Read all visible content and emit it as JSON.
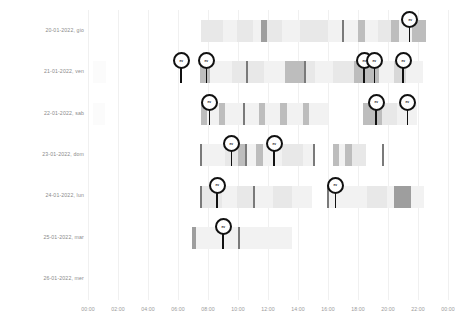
{
  "chart_data": {
    "type": "heatmap",
    "title": "",
    "xlabel": "",
    "ylabel": "",
    "grid": true,
    "legend": "none",
    "x_axis": {
      "min_hour": 0,
      "max_hour": 24,
      "tick_labels": [
        "00:00",
        "02:00",
        "04:00",
        "06:00",
        "08:00",
        "10:00",
        "12:00",
        "14:00",
        "16:00",
        "18:00",
        "20:00",
        "22:00",
        "00:00"
      ],
      "tick_hours": [
        0,
        2,
        4,
        6,
        8,
        10,
        12,
        14,
        16,
        18,
        20,
        22,
        24
      ]
    },
    "y_axis": {
      "categories": [
        "20-01-2022, gio",
        "21-01-2022, ven",
        "22-01-2022, sab",
        "23-01-2022, dom",
        "24-01-2022, lun",
        "25-01-2022, mar",
        "26-01-2022, mer"
      ]
    },
    "colors": {
      "background": "#ffffff",
      "gridline": "#f0f0f0",
      "label_text": "#8a8a8a",
      "tick_text": "#9a9a9a",
      "marker_stroke": "#111111",
      "marker_fill": "#ffffff",
      "intensity_scale": [
        "#fbfbfb",
        "#f2f2f2",
        "#e8e8e8",
        "#d8d8d8",
        "#bdbdbd",
        "#9e9e9e",
        "#7a7a7a",
        "#5a5a5a"
      ]
    },
    "rows": [
      {
        "label": "20-01-2022, gio",
        "segments": [
          {
            "start": 7.55,
            "end": 9.0,
            "value": 0.28
          },
          {
            "start": 9.0,
            "end": 9.9,
            "value": 0.12
          },
          {
            "start": 9.9,
            "end": 11.0,
            "value": 0.26
          },
          {
            "start": 11.0,
            "end": 11.5,
            "value": 0.1
          },
          {
            "start": 11.5,
            "end": 11.95,
            "value": 0.78
          },
          {
            "start": 11.95,
            "end": 12.9,
            "value": 0.22
          },
          {
            "start": 12.9,
            "end": 14.1,
            "value": 0.09
          },
          {
            "start": 14.1,
            "end": 15.3,
            "value": 0.22
          },
          {
            "start": 15.3,
            "end": 16.0,
            "value": 0.32
          },
          {
            "start": 16.0,
            "end": 16.9,
            "value": 0.09
          },
          {
            "start": 16.9,
            "end": 17.05,
            "value": 0.82
          },
          {
            "start": 17.05,
            "end": 18.0,
            "value": 0.09
          },
          {
            "start": 18.0,
            "end": 18.45,
            "value": 0.58
          },
          {
            "start": 18.45,
            "end": 19.3,
            "value": 0.1
          },
          {
            "start": 19.3,
            "end": 20.2,
            "value": 0.3
          },
          {
            "start": 20.2,
            "end": 20.75,
            "value": 0.55
          },
          {
            "start": 20.75,
            "end": 21.6,
            "value": 0.2
          },
          {
            "start": 21.6,
            "end": 22.55,
            "value": 0.62
          }
        ],
        "markers": [
          {
            "hour": 21.45,
            "label": "ev"
          }
        ]
      },
      {
        "label": "21-01-2022, ven",
        "segments": [
          {
            "start": 0.35,
            "end": 1.2,
            "value": 0.06
          },
          {
            "start": 7.45,
            "end": 8.1,
            "value": 0.52
          },
          {
            "start": 8.1,
            "end": 9.6,
            "value": 0.2
          },
          {
            "start": 9.6,
            "end": 10.5,
            "value": 0.28
          },
          {
            "start": 10.5,
            "end": 10.65,
            "value": 0.8
          },
          {
            "start": 10.65,
            "end": 11.7,
            "value": 0.22
          },
          {
            "start": 11.7,
            "end": 13.1,
            "value": 0.1
          },
          {
            "start": 13.1,
            "end": 14.4,
            "value": 0.55
          },
          {
            "start": 14.4,
            "end": 14.55,
            "value": 0.85
          },
          {
            "start": 14.55,
            "end": 15.1,
            "value": 0.34
          },
          {
            "start": 15.1,
            "end": 16.3,
            "value": 0.12
          },
          {
            "start": 16.3,
            "end": 17.7,
            "value": 0.24
          },
          {
            "start": 17.7,
            "end": 19.4,
            "value": 0.6
          },
          {
            "start": 19.4,
            "end": 20.4,
            "value": 0.14
          },
          {
            "start": 20.4,
            "end": 21.2,
            "value": 0.46
          },
          {
            "start": 21.2,
            "end": 22.3,
            "value": 0.12
          }
        ],
        "markers": [
          {
            "hour": 6.2,
            "label": "ev"
          },
          {
            "hour": 7.9,
            "label": "ev"
          },
          {
            "hour": 18.4,
            "label": "ev"
          },
          {
            "hour": 19.1,
            "label": "ev"
          },
          {
            "hour": 21.0,
            "label": "ev"
          }
        ]
      },
      {
        "label": "22-01-2022, sab",
        "segments": [
          {
            "start": 0.3,
            "end": 1.1,
            "value": 0.07
          },
          {
            "start": 7.5,
            "end": 7.95,
            "value": 0.62
          },
          {
            "start": 7.95,
            "end": 8.7,
            "value": 0.2
          },
          {
            "start": 8.7,
            "end": 9.1,
            "value": 0.6
          },
          {
            "start": 9.1,
            "end": 10.3,
            "value": 0.16
          },
          {
            "start": 10.3,
            "end": 10.45,
            "value": 0.8
          },
          {
            "start": 10.45,
            "end": 11.4,
            "value": 0.12
          },
          {
            "start": 11.4,
            "end": 11.8,
            "value": 0.55
          },
          {
            "start": 11.8,
            "end": 12.8,
            "value": 0.14
          },
          {
            "start": 12.8,
            "end": 13.25,
            "value": 0.58
          },
          {
            "start": 13.25,
            "end": 14.3,
            "value": 0.14
          },
          {
            "start": 14.3,
            "end": 14.75,
            "value": 0.58
          },
          {
            "start": 14.75,
            "end": 16.0,
            "value": 0.16
          },
          {
            "start": 18.3,
            "end": 19.6,
            "value": 0.56
          },
          {
            "start": 19.6,
            "end": 20.6,
            "value": 0.24
          },
          {
            "start": 20.6,
            "end": 21.9,
            "value": 0.14
          }
        ],
        "markers": [
          {
            "hour": 8.1,
            "label": "ev"
          },
          {
            "hour": 19.2,
            "label": "ev"
          },
          {
            "hour": 21.3,
            "label": "ev"
          }
        ]
      },
      {
        "label": "23-01-2022, dom",
        "segments": [
          {
            "start": 7.45,
            "end": 7.6,
            "value": 0.82
          },
          {
            "start": 7.6,
            "end": 9.1,
            "value": 0.16
          },
          {
            "start": 9.1,
            "end": 10.0,
            "value": 0.24
          },
          {
            "start": 10.0,
            "end": 10.45,
            "value": 0.5
          },
          {
            "start": 10.45,
            "end": 10.6,
            "value": 0.8
          },
          {
            "start": 10.6,
            "end": 11.2,
            "value": 0.2
          },
          {
            "start": 11.2,
            "end": 11.65,
            "value": 0.55
          },
          {
            "start": 11.65,
            "end": 12.9,
            "value": 0.14
          },
          {
            "start": 12.9,
            "end": 14.3,
            "value": 0.22
          },
          {
            "start": 14.3,
            "end": 15.0,
            "value": 0.14
          },
          {
            "start": 15.0,
            "end": 15.15,
            "value": 0.82
          },
          {
            "start": 16.3,
            "end": 16.75,
            "value": 0.55
          },
          {
            "start": 16.75,
            "end": 17.1,
            "value": 0.2
          },
          {
            "start": 17.1,
            "end": 17.6,
            "value": 0.58
          },
          {
            "start": 17.6,
            "end": 18.5,
            "value": 0.22
          },
          {
            "start": 19.6,
            "end": 19.75,
            "value": 0.8
          }
        ],
        "markers": [
          {
            "hour": 9.55,
            "label": "ev"
          },
          {
            "hour": 12.4,
            "label": "ev"
          }
        ]
      },
      {
        "label": "24-01-2022, lun",
        "segments": [
          {
            "start": 7.45,
            "end": 7.6,
            "value": 0.82
          },
          {
            "start": 7.6,
            "end": 8.9,
            "value": 0.22
          },
          {
            "start": 8.9,
            "end": 9.9,
            "value": 0.12
          },
          {
            "start": 9.9,
            "end": 11.0,
            "value": 0.22
          },
          {
            "start": 11.0,
            "end": 11.15,
            "value": 0.8
          },
          {
            "start": 11.15,
            "end": 12.3,
            "value": 0.1
          },
          {
            "start": 12.3,
            "end": 13.6,
            "value": 0.22
          },
          {
            "start": 13.6,
            "end": 14.9,
            "value": 0.14
          },
          {
            "start": 15.9,
            "end": 16.05,
            "value": 0.82
          },
          {
            "start": 16.05,
            "end": 17.4,
            "value": 0.18
          },
          {
            "start": 17.4,
            "end": 18.6,
            "value": 0.12
          },
          {
            "start": 18.6,
            "end": 19.9,
            "value": 0.3
          },
          {
            "start": 19.9,
            "end": 20.4,
            "value": 0.12
          },
          {
            "start": 20.4,
            "end": 21.5,
            "value": 0.7
          },
          {
            "start": 21.5,
            "end": 22.4,
            "value": 0.14
          }
        ],
        "markers": [
          {
            "hour": 8.6,
            "label": "ev"
          },
          {
            "hour": 16.5,
            "label": "ev"
          }
        ]
      },
      {
        "label": "25-01-2022, mar",
        "segments": [
          {
            "start": 6.95,
            "end": 7.2,
            "value": 0.72
          },
          {
            "start": 7.2,
            "end": 8.4,
            "value": 0.2
          },
          {
            "start": 8.4,
            "end": 10.0,
            "value": 0.12
          },
          {
            "start": 10.0,
            "end": 10.15,
            "value": 0.8
          },
          {
            "start": 10.15,
            "end": 11.3,
            "value": 0.08
          },
          {
            "start": 11.3,
            "end": 12.6,
            "value": 0.14
          },
          {
            "start": 12.6,
            "end": 13.6,
            "value": 0.2
          }
        ],
        "markers": [
          {
            "hour": 9.0,
            "label": "ev"
          }
        ]
      },
      {
        "label": "26-01-2022, mer",
        "segments": [],
        "markers": []
      }
    ]
  }
}
